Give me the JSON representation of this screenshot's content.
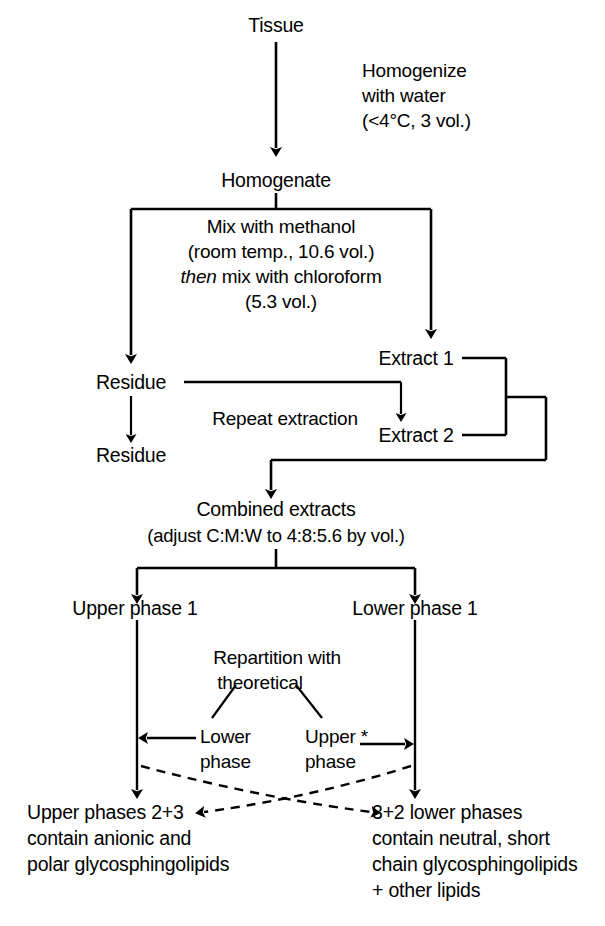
{
  "diagram": {
    "type": "flowchart",
    "ink_color": "#000000",
    "background": "#ffffff",
    "nodes": {
      "tissue": "Tissue",
      "homogenate": "Homogenate",
      "residue_1": "Residue",
      "residue_2": "Residue",
      "extract_1": "Extract 1",
      "extract_2": "Extract 2",
      "combined_extracts": "Combined extracts",
      "combined_extracts_detail": "(adjust C:M:W to 4:8:5.6 by vol.)",
      "upper_phase_1": "Upper phase 1",
      "lower_phase_1": "Lower phase 1"
    },
    "annotations": {
      "homogenize_line1": "Homogenize",
      "homogenize_line2": "with water",
      "homogenize_line3": "(<4°C, 3 vol.)",
      "mix_line1": "Mix with methanol",
      "mix_line2": "(room temp., 10.6 vol.)",
      "mix_line3_italic": "then",
      "mix_line3_rest": " mix with chloroform",
      "mix_line4": "(5.3 vol.)",
      "repeat_extraction": "Repeat extraction",
      "repartition_line1": "Repartition with",
      "repartition_line2": "theoretical",
      "lower_phase_line1": "Lower",
      "lower_phase_line2": "phase",
      "upper_phase_line1": "Upper *",
      "upper_phase_line2": "phase"
    },
    "outcomes": {
      "left_line1": "Upper phases 2+3",
      "left_line2": "contain anionic and",
      "left_line3": "polar glycosphingolipids",
      "right_line1": "3+2 lower phases",
      "right_line2": "contain neutral, short",
      "right_line3": "chain glycosphingolipids",
      "right_line4": "+ other lipids"
    }
  }
}
